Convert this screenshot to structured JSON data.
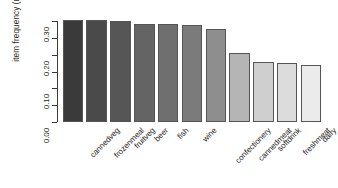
{
  "chart_data": {
    "type": "bar",
    "title": "",
    "subtitle": "",
    "xlabel": "",
    "ylabel": "item frequency (relative)",
    "categories": [
      "cannedveg",
      "frozenmeal",
      "fruitveg",
      "beer",
      "fish",
      "wine",
      "confectionery",
      "cannedmeat",
      "softdrink",
      "freshmeat",
      "dairy"
    ],
    "values": [
      0.303,
      0.302,
      0.299,
      0.291,
      0.291,
      0.288,
      0.276,
      0.204,
      0.177,
      0.174,
      0.168
    ],
    "bar_colors": [
      "#3a3a3a",
      "#4a4a4a",
      "#565656",
      "#646464",
      "#6f6f6f",
      "#7b7b7b",
      "#8e8e8e",
      "#b5b5b5",
      "#cfcfcf",
      "#dcdcdc",
      "#ebebeb"
    ],
    "bar_border_color": "#555555",
    "ylim": [
      0.0,
      0.3
    ],
    "ytick_values": [
      0.0,
      0.05,
      0.1,
      0.15,
      0.2,
      0.25,
      0.3
    ],
    "ytick_labels": [
      "0.00",
      "",
      "0.10",
      "",
      "0.20",
      "",
      "0.30"
    ],
    "grid": false,
    "legend": null,
    "axis_color": "#3a3a3a",
    "background": "#ffffff"
  }
}
